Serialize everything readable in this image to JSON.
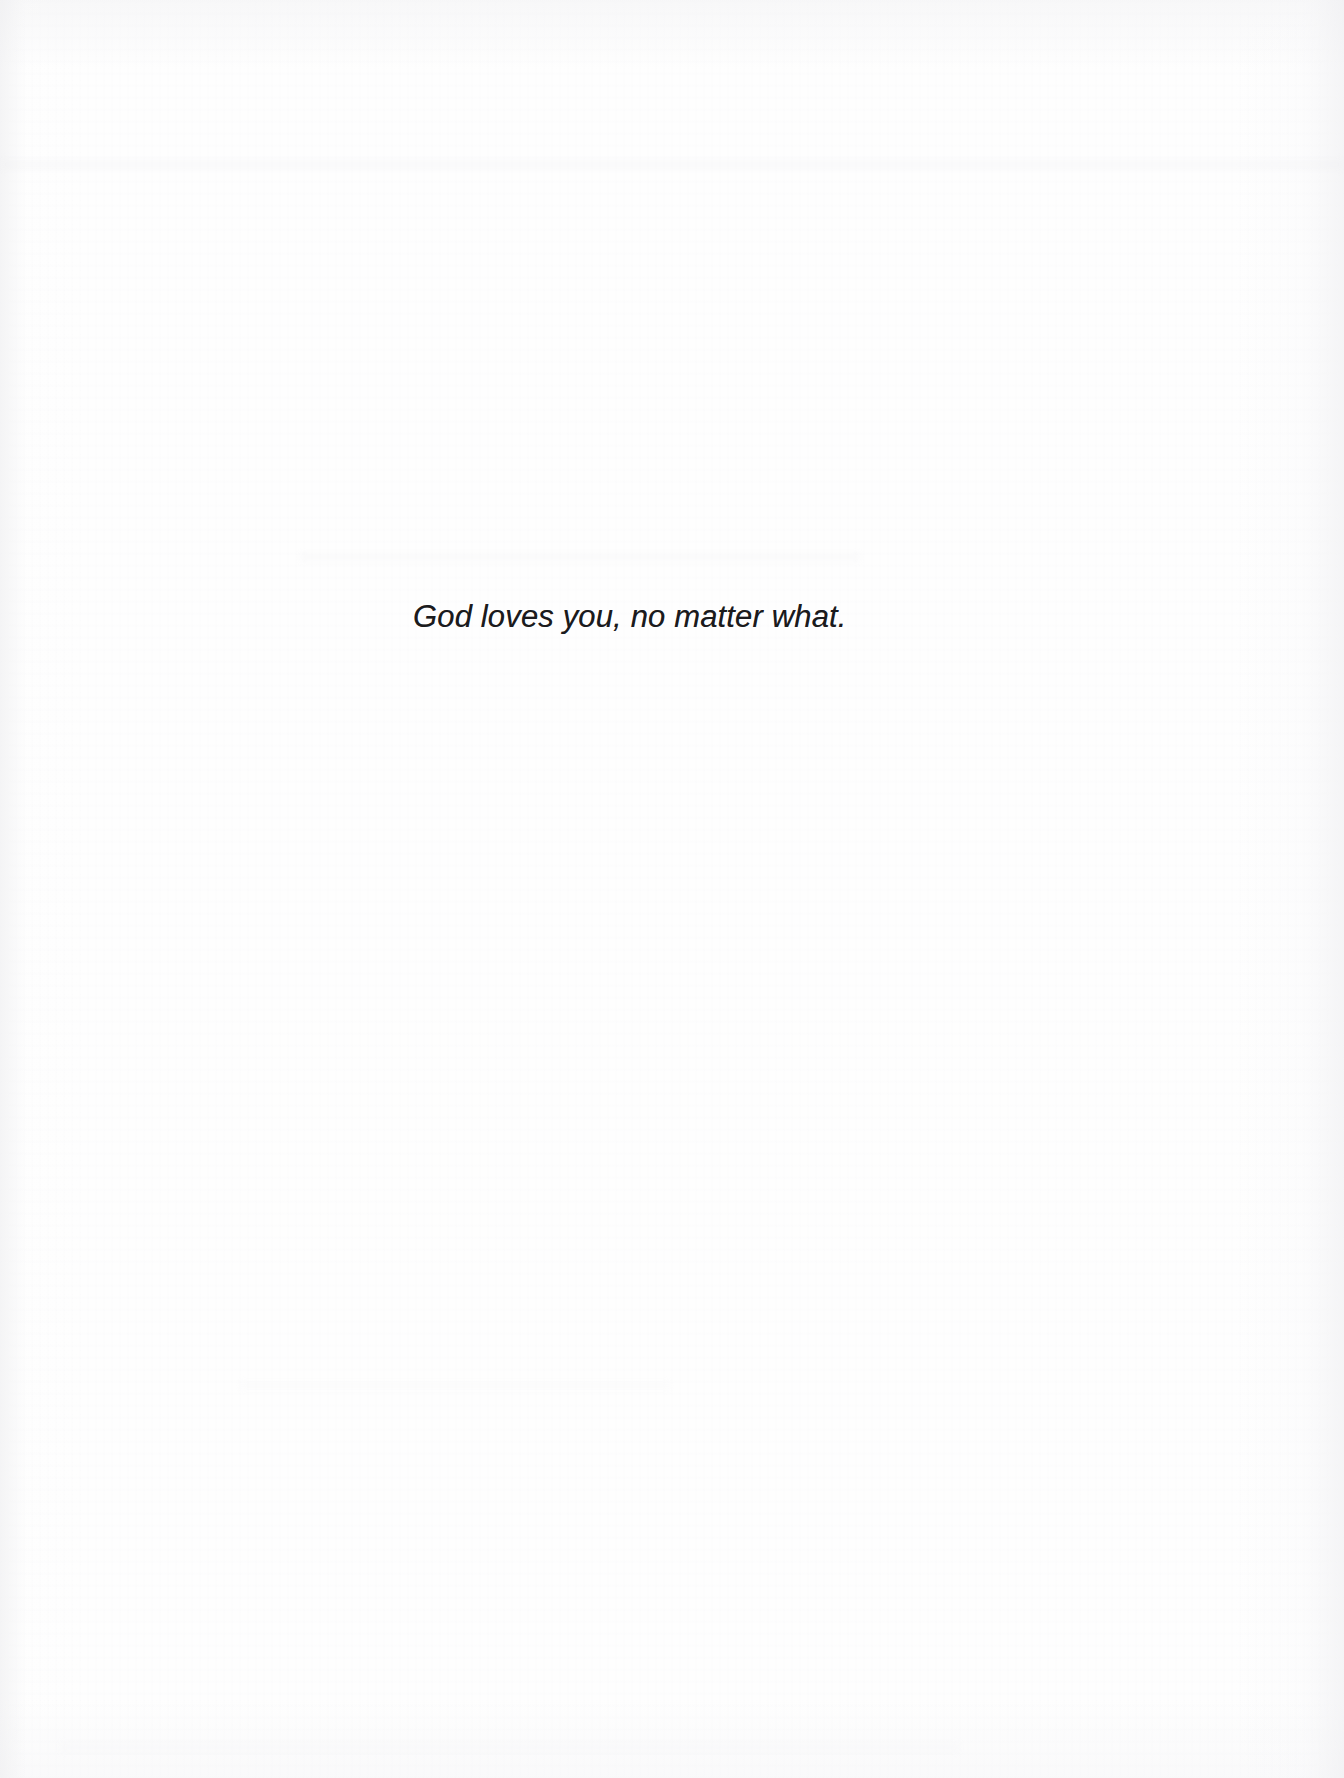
{
  "document": {
    "kind": "scanned-book-page",
    "page_background_color": "#fefefe",
    "text_color": "#1b1b1d",
    "body": {
      "quote": "God loves you, no matter what."
    }
  }
}
